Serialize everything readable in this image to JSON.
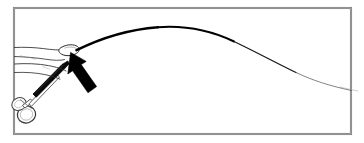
{
  "figure": {
    "title": "Surgical illustration: fingertip grasping guidewire tip with hemostat",
    "domain": "line-art-medical-illustration",
    "canvas": {
      "width": 364,
      "height": 143
    },
    "background_color": "#ffffff",
    "ink_color": "#000000",
    "frame": {
      "name": "illustration-border",
      "x": 13,
      "y": 7,
      "width": 338,
      "height": 127,
      "stroke_color": "#6b6b6b",
      "stroke_width": 2.0,
      "fill": "none"
    },
    "elements": [
      {
        "name": "guidewire-curve",
        "label": "Guidewire arcing from fingertip to the right edge",
        "stroke_color": "#000000",
        "start": {
          "x": 77,
          "y": 50
        },
        "apex": {
          "x": 158,
          "y": 27
        },
        "end": {
          "x": 351,
          "y": 90
        },
        "stroke_width_start": 2.6,
        "stroke_width_end": 0.45,
        "taper": "thick-at-tip-thin-at-far-end"
      },
      {
        "name": "hand-outline",
        "label": "Index finger and thumb outline in left-hand region",
        "stroke_color": "#1a1a1a",
        "stroke_width": 0.8,
        "fill": "#ffffff"
      },
      {
        "name": "fingertip-pad",
        "label": "Fingertip pad pinching the guidewire tip",
        "stroke_color": "#1a1a1a",
        "stroke_width": 0.8,
        "fill": "#ffffff"
      },
      {
        "name": "hemostat-forceps",
        "label": "Hemostat / needle-holder with ring handles and dark jaw shaft",
        "shaft_color": "#000000",
        "handle_color": "#3a3a3a",
        "ring_count": 2
      },
      {
        "name": "pointer-arrow",
        "label": "Solid black arrow indicating the pinch point at the fingertip",
        "fill_color": "#000000",
        "direction": "up-left",
        "angle_degrees": 222,
        "tip": {
          "x": 72,
          "y": 54
        },
        "tail": {
          "x": 97,
          "y": 90
        }
      }
    ]
  }
}
